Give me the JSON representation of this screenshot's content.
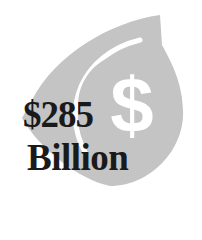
{
  "infographic": {
    "amount": "$285",
    "unit": "Billion",
    "icon": "dollar-sign-icon",
    "colors": {
      "shape": "#c4c4c4",
      "text": "#1a1a1a",
      "background": "#ffffff",
      "accent": "#ffffff"
    }
  }
}
